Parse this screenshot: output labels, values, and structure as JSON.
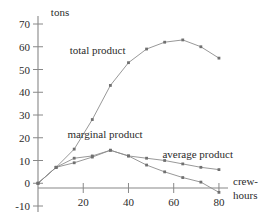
{
  "chart_data": {
    "type": "line",
    "title": "",
    "xlabel": "crew-hours",
    "ylabel": "tons",
    "xlim": [
      0,
      84
    ],
    "ylim": [
      -10,
      70
    ],
    "grid": false,
    "legend_position": "inline-annotations",
    "xticks": [
      20,
      40,
      60,
      80
    ],
    "xtick_labels": [
      "20",
      "40",
      "60",
      "80"
    ],
    "yticks": [
      -10,
      0,
      10,
      20,
      30,
      40,
      50,
      60,
      70
    ],
    "ytick_labels": [
      "-10",
      "0",
      "10",
      "20",
      "30",
      "40",
      "50",
      "60",
      "70"
    ],
    "x": [
      0,
      8,
      16,
      24,
      32,
      40,
      48,
      56,
      64,
      72,
      80
    ],
    "series": [
      {
        "name": "total product",
        "values": [
          0,
          7,
          15,
          28,
          43,
          53,
          59,
          62,
          63,
          60,
          55
        ]
      },
      {
        "name": "marginal product",
        "values": [
          0,
          7,
          9,
          11.5,
          14.5,
          12,
          8,
          5,
          2.5,
          0.5,
          -4
        ]
      },
      {
        "name": "average product",
        "values": [
          0,
          7,
          11,
          12,
          14.5,
          12,
          11,
          10,
          8.5,
          7,
          6
        ]
      }
    ],
    "annotations": [
      {
        "text": "total product",
        "x": 14,
        "y": 57
      },
      {
        "text": "marginal product",
        "x": 13,
        "y": 20
      },
      {
        "text": "average product",
        "x": 55,
        "y": 11
      }
    ]
  },
  "axis": {
    "y_unit_label": "tons",
    "x_unit_label_line1": "crew-",
    "x_unit_label_line2": "hours"
  },
  "colors": {
    "line": "#8c8c8c",
    "marker": "#707070",
    "axis": "#888888",
    "text": "#2b2b2b"
  }
}
